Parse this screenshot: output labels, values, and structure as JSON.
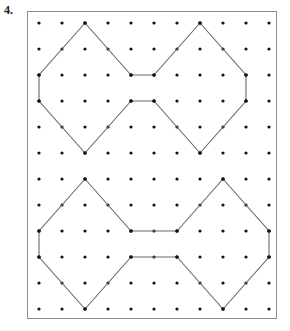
{
  "page": {
    "width": 290,
    "height": 331,
    "background_color": "#ffffff"
  },
  "problem": {
    "number_label": "4.",
    "label_color": "#1a1a1a"
  },
  "board": {
    "frame": {
      "x": 27,
      "y": 11,
      "width": 250,
      "height": 308,
      "border_color": "#8e8e8e",
      "border_width": 1,
      "fill_color": "#ffffff"
    },
    "grid": {
      "columns": 11,
      "rows": 12,
      "origin_x": 38,
      "origin_y": 22,
      "spacing_x": 23,
      "spacing_y": 26,
      "dot_radius": 1.6,
      "dot_color": "#111111"
    },
    "polygon_style": {
      "stroke_color": "#6b6b6b",
      "stroke_width": 1.1,
      "fill": "none",
      "vertex_dot_color": "#111111",
      "vertex_dot_radius": 1.8
    }
  },
  "shapes": [
    {
      "name": "top-hexagon-pair",
      "description": "bowtie of two hexagons meeting at a one-unit waist",
      "closed": true,
      "vertices_grid": [
        [
          2,
          0
        ],
        [
          0,
          2
        ],
        [
          0,
          3
        ],
        [
          2,
          5
        ],
        [
          4,
          3
        ],
        [
          5,
          3
        ],
        [
          7,
          5
        ],
        [
          9,
          3
        ],
        [
          9,
          2
        ],
        [
          7,
          0
        ],
        [
          5,
          2
        ],
        [
          4,
          2
        ]
      ],
      "waist_columns": [
        4,
        5
      ],
      "waist_span_units": 1
    },
    {
      "name": "bottom-hexagon-pair",
      "description": "bowtie of two hexagons meeting at a two-unit waist, right side one column wider",
      "closed": true,
      "vertices_grid": [
        [
          2,
          6
        ],
        [
          0,
          8
        ],
        [
          0,
          9
        ],
        [
          2,
          11
        ],
        [
          4,
          9
        ],
        [
          6,
          9
        ],
        [
          8,
          11
        ],
        [
          10,
          9
        ],
        [
          10,
          8
        ],
        [
          8,
          6
        ],
        [
          6,
          8
        ],
        [
          4,
          8
        ]
      ],
      "waist_columns": [
        4,
        6
      ],
      "waist_span_units": 2
    }
  ]
}
